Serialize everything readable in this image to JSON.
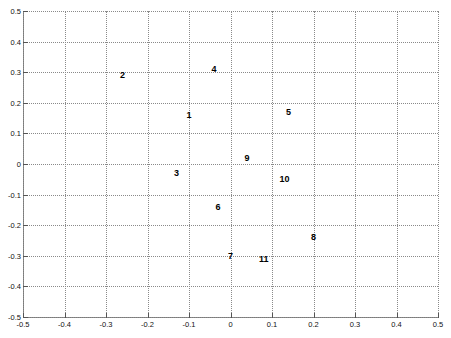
{
  "chart_data": {
    "type": "scatter",
    "title": "",
    "xlabel": "",
    "ylabel": "",
    "xlim": [
      -0.5,
      0.5
    ],
    "ylim": [
      -0.5,
      0.5
    ],
    "grid": true,
    "legend": "none",
    "marker_style": "numeric-label",
    "xticks": [
      "-0.5",
      "-0.4",
      "-0.3",
      "-0.2",
      "-0.1",
      "0",
      "0.1",
      "0.2",
      "0.3",
      "0.4",
      "0.5"
    ],
    "xtick_values": [
      -0.5,
      -0.4,
      -0.3,
      -0.2,
      -0.1,
      0,
      0.1,
      0.2,
      0.3,
      0.4,
      0.5
    ],
    "yticks": [
      "0.5",
      "0.4",
      "0.3",
      "0.2",
      "0.1",
      "0",
      "-0.1",
      "-0.2",
      "-0.3",
      "-0.4",
      "-0.5"
    ],
    "ytick_values": [
      0.5,
      0.4,
      0.3,
      0.2,
      0.1,
      0,
      -0.1,
      -0.2,
      -0.3,
      -0.4,
      -0.5
    ],
    "points": [
      {
        "label": "1",
        "x": -0.1,
        "y": 0.16
      },
      {
        "label": "2",
        "x": -0.26,
        "y": 0.29
      },
      {
        "label": "3",
        "x": -0.13,
        "y": -0.03
      },
      {
        "label": "4",
        "x": -0.04,
        "y": 0.31
      },
      {
        "label": "5",
        "x": 0.14,
        "y": 0.17
      },
      {
        "label": "6",
        "x": -0.03,
        "y": -0.14
      },
      {
        "label": "7",
        "x": 0.0,
        "y": -0.3
      },
      {
        "label": "8",
        "x": 0.2,
        "y": -0.24
      },
      {
        "label": "9",
        "x": 0.04,
        "y": 0.02
      },
      {
        "label": "10",
        "x": 0.13,
        "y": -0.05
      },
      {
        "label": "11",
        "x": 0.08,
        "y": -0.31
      }
    ],
    "colors": {
      "background": "#ffffff",
      "axis": "#7a7a7a",
      "grid": "#8a8a8a",
      "label": "#000000"
    }
  }
}
